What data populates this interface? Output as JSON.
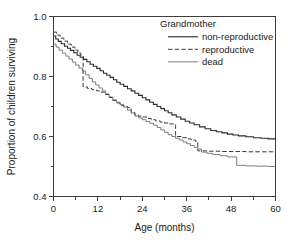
{
  "chart_data": {
    "type": "line",
    "title": "",
    "subtitle": "",
    "xlabel": "Age (months)",
    "ylabel": "Proportion of children surviving",
    "xlim": [
      0,
      60
    ],
    "ylim": [
      0.4,
      1.0
    ],
    "grid": false,
    "x_ticks": [
      0,
      12,
      24,
      36,
      48,
      60
    ],
    "x_tick_labels": [
      "0",
      "12",
      "24",
      "36",
      "48",
      "60"
    ],
    "x_minor_ticks": [
      6,
      18,
      30,
      42,
      54
    ],
    "y_ticks": [
      0.4,
      0.6,
      0.8,
      1.0
    ],
    "y_tick_labels": [
      "0.4",
      "0.6",
      "0.8",
      "1.0"
    ],
    "y_minor_ticks": [
      0.5,
      0.7,
      0.9
    ],
    "legend": {
      "title": "Grandmother",
      "position": "top-right",
      "entries": [
        {
          "label": "non-reproductive",
          "style": "solid",
          "color": "#2b2b2b",
          "width": 1.1
        },
        {
          "label": "reproductive",
          "style": "dashed",
          "color": "#3a3a3a",
          "width": 1.0
        },
        {
          "label": "dead",
          "style": "solid",
          "color": "#6e6e6e",
          "width": 0.9
        }
      ]
    },
    "series": [
      {
        "name": "non-reproductive",
        "style": "solid",
        "color": "#2b2b2b",
        "width": 1.1,
        "step": "post",
        "x": [
          0,
          0.6,
          1.3,
          2.1,
          3.0,
          3.8,
          4.6,
          5.5,
          6.4,
          7.2,
          8.1,
          9.0,
          9.9,
          10.8,
          11.7,
          12.6,
          13.5,
          14.4,
          15.3,
          16.2,
          17.1,
          18.0,
          19.0,
          20.0,
          21.0,
          22.0,
          23.0,
          24.0,
          25.0,
          26.0,
          27.0,
          28.0,
          29.0,
          30.0,
          31.0,
          32.0,
          33.2,
          34.4,
          35.6,
          36.8,
          38.0,
          39.5,
          41.0,
          42.5,
          44.0,
          45.5,
          47.0,
          48.5,
          50.0,
          52.0,
          54.0,
          56.0,
          58.0,
          60.0
        ],
        "y": [
          0.935,
          0.925,
          0.917,
          0.909,
          0.901,
          0.894,
          0.887,
          0.879,
          0.871,
          0.864,
          0.857,
          0.849,
          0.841,
          0.834,
          0.827,
          0.819,
          0.811,
          0.804,
          0.797,
          0.789,
          0.781,
          0.774,
          0.767,
          0.759,
          0.752,
          0.744,
          0.737,
          0.729,
          0.722,
          0.714,
          0.707,
          0.7,
          0.693,
          0.686,
          0.679,
          0.672,
          0.665,
          0.658,
          0.651,
          0.645,
          0.639,
          0.632,
          0.626,
          0.62,
          0.616,
          0.612,
          0.608,
          0.605,
          0.602,
          0.599,
          0.596,
          0.594,
          0.592,
          0.59
        ]
      },
      {
        "name": "reproductive",
        "style": "dashed",
        "color": "#3a3a3a",
        "width": 1.0,
        "step": "post",
        "x": [
          0,
          0.8,
          1.8,
          2.8,
          3.8,
          4.8,
          5.8,
          6.6,
          7.4,
          8.0,
          8.0,
          9.2,
          10.4,
          11.6,
          12.8,
          14.0,
          15.0,
          16.0,
          17.0,
          18.0,
          19.0,
          20.0,
          21.0,
          22.0,
          23.0,
          24.0,
          25.2,
          26.4,
          27.6,
          28.8,
          30.0,
          31.2,
          32.4,
          33.0,
          33.0,
          34.5,
          36.0,
          37.2,
          38.4,
          39.0,
          39.0,
          42.0,
          45.0,
          48.0,
          52.0,
          56.0,
          60.0
        ],
        "y": [
          0.948,
          0.938,
          0.928,
          0.918,
          0.908,
          0.898,
          0.888,
          0.878,
          0.868,
          0.858,
          0.765,
          0.76,
          0.756,
          0.752,
          0.748,
          0.74,
          0.73,
          0.72,
          0.712,
          0.704,
          0.7,
          0.696,
          0.68,
          0.672,
          0.668,
          0.665,
          0.66,
          0.656,
          0.652,
          0.648,
          0.645,
          0.642,
          0.64,
          0.638,
          0.6,
          0.596,
          0.592,
          0.588,
          0.584,
          0.58,
          0.552,
          0.551,
          0.55,
          0.55,
          0.549,
          0.549,
          0.549
        ]
      },
      {
        "name": "dead",
        "style": "solid",
        "color": "#6e6e6e",
        "width": 0.9,
        "step": "post",
        "x": [
          0,
          0.7,
          1.5,
          2.4,
          3.3,
          4.2,
          5.1,
          6.0,
          6.9,
          7.8,
          8.7,
          9.6,
          10.5,
          11.4,
          12.3,
          13.2,
          14.1,
          15.0,
          16.0,
          17.0,
          18.0,
          19.0,
          20.0,
          21.0,
          22.0,
          23.0,
          24.0,
          25.0,
          26.0,
          27.0,
          28.0,
          29.0,
          30.0,
          31.0,
          32.0,
          33.0,
          34.0,
          35.0,
          36.0,
          37.0,
          38.0,
          39.0,
          40.0,
          41.5,
          43.0,
          45.0,
          47.0,
          49.5,
          49.5,
          52.0,
          55.0,
          58.0,
          60.0
        ],
        "y": [
          0.908,
          0.898,
          0.888,
          0.878,
          0.868,
          0.858,
          0.848,
          0.838,
          0.828,
          0.818,
          0.806,
          0.794,
          0.782,
          0.772,
          0.762,
          0.752,
          0.742,
          0.732,
          0.722,
          0.714,
          0.706,
          0.698,
          0.688,
          0.678,
          0.668,
          0.662,
          0.656,
          0.65,
          0.644,
          0.638,
          0.63,
          0.622,
          0.614,
          0.606,
          0.6,
          0.594,
          0.588,
          0.582,
          0.576,
          0.57,
          0.564,
          0.558,
          0.548,
          0.544,
          0.54,
          0.536,
          0.532,
          0.528,
          0.504,
          0.502,
          0.501,
          0.5,
          0.5
        ]
      }
    ]
  }
}
